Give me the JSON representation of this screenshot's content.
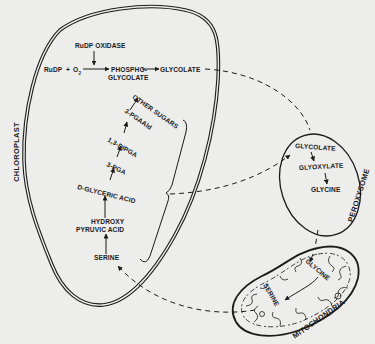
{
  "figure": {
    "compartments": {
      "chloroplast": "CHLOROPLAST",
      "peroxysome": "PEROXYSOME",
      "mitochondria": "MITOCHONDRIA"
    },
    "chloroplast": {
      "enzyme": "RuDP OXIDASE",
      "substrate_a": "RuDP",
      "plus": "+",
      "substrate_b": "O",
      "substrate_b_sub": "2",
      "product_1_line1": "PHOSPHO-",
      "product_1_line2": "GLYCOLATE",
      "product_2": "GLYCOLATE",
      "chain": {
        "other_sugars": "OTHER SUGARS",
        "pgaald": "3-PGAAld",
        "dipga": "1,3-DIPGA",
        "pga": "3-PGA",
        "glyceric": "D-GLYCERIC ACID",
        "hydroxy_line1": "HYDROXY",
        "hydroxy_line2": "PYRUVIC ACID",
        "serine": "SERINE"
      }
    },
    "peroxysome": {
      "glycolate": "GLYCOLATE",
      "glyoxylate": "GLYOXYLATE",
      "glycine": "GLYCINE"
    },
    "mitochondria": {
      "glycine": "GLYCINE",
      "serine": "SERINE"
    }
  }
}
